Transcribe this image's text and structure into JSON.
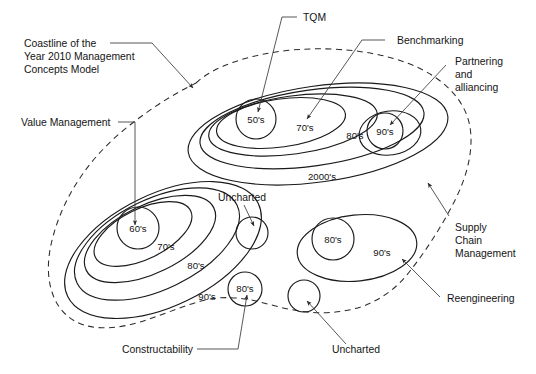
{
  "figure": {
    "title": "Coastline of the Year 2010 Management Concepts Model",
    "background_color": "#ffffff",
    "line_color": "#1a1a1a",
    "coastline_style": "dashed"
  },
  "callouts": {
    "coastline": {
      "line1": "Coastline of the",
      "line2": "Year 2010 Management",
      "line3": "Concepts Model"
    },
    "value_management": "Value Management",
    "tqm": "TQM",
    "benchmarking": "Benchmarking",
    "partnering": {
      "line1": "Partnering",
      "line2": "and",
      "line3": "alliancing"
    },
    "supply_chain": {
      "line1": "Supply",
      "line2": "Chain",
      "line3": "Management"
    },
    "reengineering": "Reengineering",
    "constructability": "Constructability",
    "uncharted_upper": "Uncharted",
    "uncharted_lower": "Uncharted"
  },
  "islands": {
    "upper": {
      "name": "upper-island",
      "contours": [
        {
          "label": "2000's",
          "level": 1
        },
        {
          "label": "80's",
          "level": 2
        },
        {
          "label": "70's",
          "level": 3
        },
        {
          "label": "50's",
          "level": 4
        }
      ],
      "satellite": {
        "label": "90's"
      }
    },
    "lower_left": {
      "name": "lower-left-island",
      "contours": [
        {
          "label": "90's",
          "level": 1
        },
        {
          "label": "80's",
          "level": 2
        },
        {
          "label": "70's",
          "level": 3
        },
        {
          "label": "60's",
          "level": 4
        }
      ],
      "satellite": {
        "label": "80's"
      }
    },
    "lower_right": {
      "name": "lower-right-island",
      "contours": [
        {
          "label": "90's",
          "level": 1
        },
        {
          "label": "80's",
          "level": 2
        }
      ]
    }
  },
  "decade_labels": {
    "upper_2000s": "2000's",
    "upper_80s": "80's",
    "upper_70s": "70's",
    "upper_50s": "50's",
    "upper_90s": "90's",
    "ll_90s": "90's",
    "ll_80s": "80's",
    "ll_70s": "70's",
    "ll_60s": "60's",
    "ll_sat_80s": "80's",
    "lr_90s": "90's",
    "lr_80s": "80's"
  }
}
